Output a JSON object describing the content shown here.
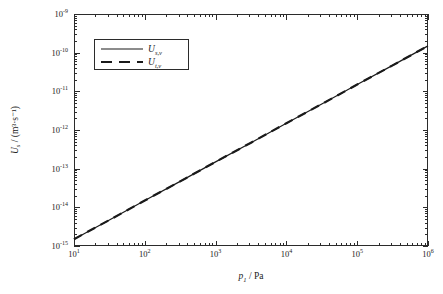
{
  "watermark": "",
  "chart_data": {
    "type": "line",
    "title": "",
    "xlabel": "p₁ / Pa",
    "xlabel_parts": {
      "symbol": "p",
      "subscript": "1",
      "separator": " / ",
      "unit": "Pa"
    },
    "ylabel": "Uₛ / (m³·s⁻¹)",
    "ylabel_parts": {
      "symbol": "U",
      "subscript": "s",
      "separator": " / ",
      "unit": "(m³·s⁻¹)"
    },
    "xscale": "log",
    "yscale": "log",
    "xlim": [
      10,
      1000000
    ],
    "ylim": [
      1e-15,
      1e-09
    ],
    "grid": false,
    "legend_position": "upper left",
    "x_ticks": [
      {
        "value": 10,
        "label_mantissa": "10",
        "label_exponent": "1"
      },
      {
        "value": 100,
        "label_mantissa": "10",
        "label_exponent": "2"
      },
      {
        "value": 1000,
        "label_mantissa": "10",
        "label_exponent": "3"
      },
      {
        "value": 10000,
        "label_mantissa": "10",
        "label_exponent": "4"
      },
      {
        "value": 100000,
        "label_mantissa": "10",
        "label_exponent": "5"
      },
      {
        "value": 1000000,
        "label_mantissa": "10",
        "label_exponent": "6"
      }
    ],
    "y_ticks": [
      {
        "value": 1e-09,
        "label_mantissa": "10",
        "label_exponent": "-9"
      },
      {
        "value": 1e-10,
        "label_mantissa": "10",
        "label_exponent": "-10"
      },
      {
        "value": 1e-11,
        "label_mantissa": "10",
        "label_exponent": "-11"
      },
      {
        "value": 1e-12,
        "label_mantissa": "10",
        "label_exponent": "-12"
      },
      {
        "value": 1e-13,
        "label_mantissa": "10",
        "label_exponent": "-13"
      },
      {
        "value": 1e-14,
        "label_mantissa": "10",
        "label_exponent": "-14"
      },
      {
        "value": 1e-15,
        "label_mantissa": "10",
        "label_exponent": "-15"
      }
    ],
    "series": [
      {
        "name": "U_s,v",
        "label_symbol": "U",
        "label_subscript": "s,v",
        "style": "solid",
        "color": "#1a1a1a",
        "x": [
          10,
          31.6,
          100,
          316,
          1000,
          3160,
          10000,
          31600,
          100000,
          316000,
          1000000
        ],
        "y": [
          1.5e-15,
          4.7e-15,
          1.5e-14,
          4.7e-14,
          1.5e-13,
          4.7e-13,
          1.5e-12,
          4.7e-12,
          1.5e-11,
          4.7e-11,
          1.5e-10
        ]
      },
      {
        "name": "U_t,v",
        "label_symbol": "U",
        "label_subscript": "t,v",
        "style": "dashed",
        "color": "#1a1a1a",
        "x": [
          10,
          31.6,
          100,
          316,
          1000,
          3160,
          10000,
          31600,
          100000,
          316000,
          1000000
        ],
        "y": [
          1.5e-15,
          4.7e-15,
          1.5e-14,
          4.7e-14,
          1.5e-13,
          4.7e-13,
          1.5e-12,
          4.7e-12,
          1.5e-11,
          4.7e-11,
          1.5e-10
        ]
      }
    ]
  }
}
